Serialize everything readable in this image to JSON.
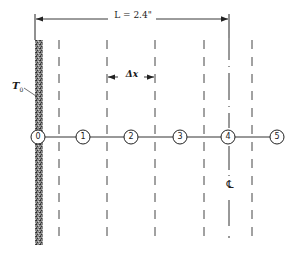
{
  "diagram": {
    "type": "finite-difference-grid",
    "dimension": {
      "label": "L = 2.4\""
    },
    "increment": {
      "label": "Δx"
    },
    "wall": {
      "label": "T",
      "subscript": "0"
    },
    "centerline": {
      "symbol": "℄"
    },
    "nodes": [
      {
        "id": "0",
        "x": 38
      },
      {
        "id": "1",
        "x": 83
      },
      {
        "id": "2",
        "x": 131
      },
      {
        "id": "3",
        "x": 180
      },
      {
        "id": "4",
        "x": 228
      },
      {
        "id": "5",
        "x": 277
      }
    ],
    "colors": {
      "line": "#333333",
      "wall": "#555555",
      "background": "#ffffff"
    }
  }
}
